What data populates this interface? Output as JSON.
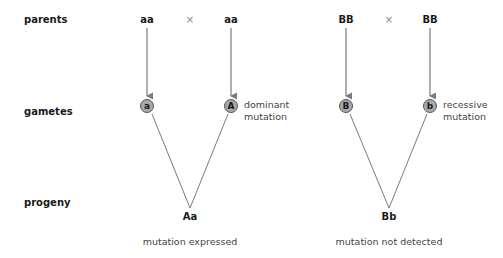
{
  "rows": {
    "parents": "parents",
    "gametes": "gametes",
    "progeny": "progeny"
  },
  "left_cross": {
    "parent1": "aa",
    "cross_symbol": "×",
    "parent2": "aa",
    "gamete1": "a",
    "gamete2": "A",
    "gamete2_note_line1": "dominant",
    "gamete2_note_line2": "mutation",
    "progeny": "Aa",
    "outcome": "mutation expressed"
  },
  "right_cross": {
    "parent1": "BB",
    "cross_symbol": "×",
    "parent2": "BB",
    "gamete1": "B",
    "gamete2": "b",
    "gamete2_note_line1": "recessive",
    "gamete2_note_line2": "mutation",
    "progeny": "Bb",
    "outcome": "mutation not detected"
  },
  "colors": {
    "line": "#7a7a7a",
    "gamete_fill": "#a8a8a8",
    "gamete_border": "#555555"
  }
}
